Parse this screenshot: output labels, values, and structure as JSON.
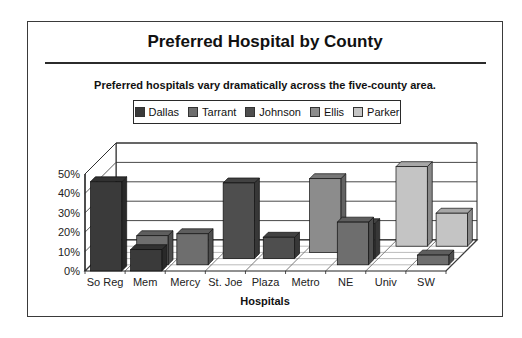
{
  "title": "Preferred Hospital by County",
  "subtitle": "Preferred hospitals vary dramatically across the five-county area.",
  "legend": [
    {
      "label": "Dallas",
      "color": "#3a3a3a"
    },
    {
      "label": "Tarrant",
      "color": "#6e6e6e"
    },
    {
      "label": "Johnson",
      "color": "#4e4e4e"
    },
    {
      "label": "Ellis",
      "color": "#8c8c8c"
    },
    {
      "label": "Parker",
      "color": "#c4c4c4"
    }
  ],
  "chart_data": {
    "type": "bar",
    "subtype": "3d-column-depth",
    "title": "Preferred Hospital by County",
    "subtitle": "Preferred hospitals vary dramatically across the five-county area.",
    "xlabel": "Hospitals",
    "ylabel": "",
    "ylim": [
      0,
      50
    ],
    "yticks": [
      "0%",
      "10%",
      "20%",
      "30%",
      "40%",
      "50%"
    ],
    "grid": true,
    "legend_position": "top",
    "categories": [
      "So Reg",
      "Mem",
      "Mercy",
      "St. Joe",
      "Plaza",
      "Metro",
      "NE",
      "Univ",
      "SW"
    ],
    "series": [
      {
        "name": "Dallas",
        "values": [
          46,
          11,
          0,
          0,
          0,
          0,
          0,
          0,
          0
        ]
      },
      {
        "name": "Tarrant",
        "values": [
          0,
          15,
          16,
          0,
          0,
          0,
          22,
          0,
          5
        ]
      },
      {
        "name": "Johnson",
        "values": [
          0,
          0,
          0,
          39,
          11,
          0,
          18,
          0,
          0
        ]
      },
      {
        "name": "Ellis",
        "values": [
          0,
          0,
          0,
          0,
          0,
          38,
          0,
          0,
          0
        ]
      },
      {
        "name": "Parker",
        "values": [
          0,
          0,
          0,
          0,
          0,
          0,
          0,
          41,
          17
        ]
      }
    ]
  }
}
